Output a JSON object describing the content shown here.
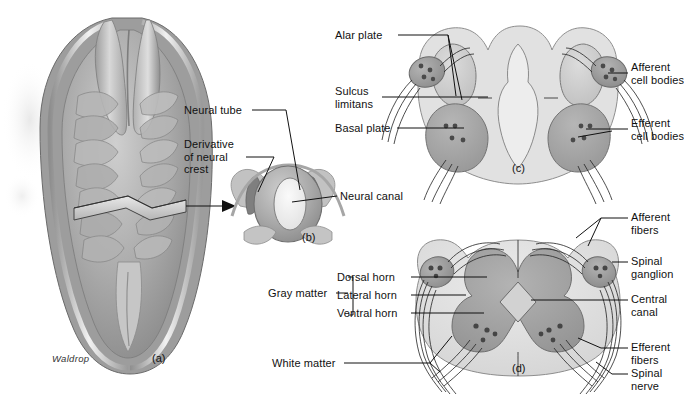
{
  "figure": {
    "signature": "Waldrop",
    "panels": [
      {
        "id": "a",
        "caption": "(a)",
        "desc": "embryo-dorsal-view-neural-folds"
      },
      {
        "id": "b",
        "caption": "(b)",
        "desc": "neural-tube-cross-section"
      },
      {
        "id": "c",
        "caption": "(c)",
        "desc": "developing-spinal-cord-cross-section"
      },
      {
        "id": "d",
        "caption": "(d)",
        "desc": "mature-spinal-cord-cross-section"
      }
    ]
  },
  "labels": {
    "panel_b": [
      {
        "key": "neural_tube",
        "text": "Neural tube"
      },
      {
        "key": "derivative_neural_crest",
        "text": "Derivative\nof neural\ncrest"
      },
      {
        "key": "neural_canal",
        "text": "Neural canal"
      }
    ],
    "panel_c": [
      {
        "key": "alar_plate",
        "text": "Alar plate"
      },
      {
        "key": "sulcus_limitans",
        "text": "Sulcus\nlimitans"
      },
      {
        "key": "basal_plate",
        "text": "Basal plate"
      },
      {
        "key": "afferent_cell_bodies",
        "text": "Afferent\ncell bodies"
      },
      {
        "key": "efferent_cell_bodies",
        "text": "Efferent\ncell bodies"
      }
    ],
    "panel_d": [
      {
        "key": "gray_matter",
        "text": "Gray matter"
      },
      {
        "key": "dorsal_horn",
        "text": "Dorsal horn"
      },
      {
        "key": "lateral_horn",
        "text": "Lateral horn"
      },
      {
        "key": "ventral_horn",
        "text": "Ventral horn"
      },
      {
        "key": "white_matter",
        "text": "White matter"
      },
      {
        "key": "afferent_fibers",
        "text": "Afferent\nfibers"
      },
      {
        "key": "spinal_ganglion",
        "text": "Spinal\nganglion"
      },
      {
        "key": "central_canal",
        "text": "Central\ncanal"
      },
      {
        "key": "efferent_fibers",
        "text": "Efferent\nfibers"
      },
      {
        "key": "spinal_nerve",
        "text": "Spinal\nnerve"
      }
    ],
    "panel_b_neural_canal_second_ref": "Neural canal"
  },
  "text": {
    "neural_tube": "Neural tube",
    "derivative_neural_crest": "Derivative\nof neural\ncrest",
    "neural_canal": "Neural canal",
    "neural_canal_d": "Neural canal",
    "alar_plate": "Alar plate",
    "sulcus_limitans": "Sulcus\nlimitans",
    "basal_plate": "Basal plate",
    "afferent_cell_bodies": "Afferent\ncell bodies",
    "efferent_cell_bodies": "Efferent\ncell bodies",
    "gray_matter": "Gray matter",
    "dorsal_horn": "Dorsal horn",
    "lateral_horn": "Lateral horn",
    "ventral_horn": "Ventral horn",
    "white_matter": "White matter",
    "afferent_fibers": "Afferent\nfibers",
    "spinal_ganglion": "Spinal\nganglion",
    "central_canal": "Central\ncanal",
    "efferent_fibers": "Efferent\nfibers",
    "spinal_nerve": "Spinal\nnerve",
    "cap_a": "(a)",
    "cap_b": "(b)",
    "cap_c": "(c)",
    "cap_d": "(d)",
    "signature": "Waldrop"
  },
  "colors": {
    "background": "#ffffff",
    "ink": "#111111",
    "gray_light": "#d9d9d9",
    "gray_mid": "#b9b9b9",
    "gray_dark": "#9a9a9a",
    "gray_darker": "#7d7d7d",
    "tissue_pale": "#e6e6e6",
    "outline": "#6e6e6e"
  }
}
